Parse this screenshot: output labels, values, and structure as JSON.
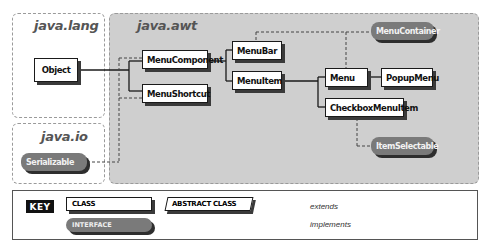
{
  "packages": {
    "lang": {
      "title": "java.lang"
    },
    "awt": {
      "title": "java.awt"
    },
    "io": {
      "title": "java.io"
    }
  },
  "classes": {
    "object": "Object",
    "menu_component": "MenuComponent",
    "menu_shortcut": "MenuShortcut",
    "menu_bar": "MenuBar",
    "menu_item": "MenuItem",
    "menu": "Menu",
    "popup_menu": "PopupMenu",
    "checkbox_menu_item": "CheckboxMenuItem"
  },
  "interfaces": {
    "serializable": "Serializable",
    "menu_container": "MenuContainer",
    "item_selectable": "ItemSelectable"
  },
  "key": {
    "label": "KEY",
    "class": "CLASS",
    "abstract_class": "ABSTRACT CLASS",
    "interface": "INTERFACE",
    "extends": "extends",
    "implements": "implements"
  },
  "colors": {
    "awt_background": "#cfcfcf",
    "interface_fill": "#7a7a7a",
    "class_fill": "#ffffff",
    "shadow": "#3a3a3a",
    "line": "#1a1a1a"
  }
}
